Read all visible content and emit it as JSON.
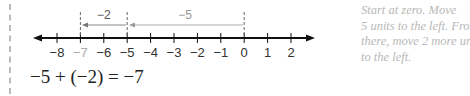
{
  "diagram": {
    "type": "number-line",
    "ticks": [
      {
        "value": -8,
        "label": "−8",
        "highlight": false
      },
      {
        "value": -7,
        "label": "−7",
        "highlight": true
      },
      {
        "value": -6,
        "label": "−6",
        "highlight": false
      },
      {
        "value": -5,
        "label": "−5",
        "highlight": false
      },
      {
        "value": -4,
        "label": "−4",
        "highlight": false
      },
      {
        "value": -3,
        "label": "−3",
        "highlight": false
      },
      {
        "value": -2,
        "label": "−2",
        "highlight": false
      },
      {
        "value": -1,
        "label": "−1",
        "highlight": false
      },
      {
        "value": 0,
        "label": "0",
        "highlight": false
      },
      {
        "value": 1,
        "label": "1",
        "highlight": false
      },
      {
        "value": 2,
        "label": "2",
        "highlight": false
      }
    ],
    "jumps": [
      {
        "from": 0,
        "to": -5,
        "label": "−5"
      },
      {
        "from": -5,
        "to": -7,
        "label": "−2"
      }
    ],
    "dashed_markers": [
      -7,
      -5,
      0
    ],
    "colors": {
      "axis": "#111111",
      "jump_arrow": "#888888",
      "highlight_label": "#aaaaaa",
      "note_text": "#b8b8b8"
    }
  },
  "equation": "−5 + (−2) = −7",
  "note": {
    "lines": [
      "Start at zero. Move",
      "5 units to the left. From",
      "there, move 2 more uni",
      "to the left."
    ]
  }
}
